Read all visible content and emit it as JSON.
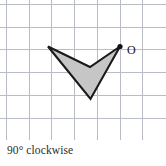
{
  "figure": {
    "caption": "90° clockwise",
    "corner_mark": "",
    "grid": {
      "line_color": "#b9bcc4",
      "background": "#ffffff",
      "spacing_px": 22.7,
      "x_positions": [
        6.5,
        29.2,
        51.9,
        74.6,
        97.3,
        120.0,
        142.7
      ],
      "y_positions": [
        4.5,
        27.2,
        49.9,
        72.6,
        95.3,
        118.0
      ],
      "x_extent": [
        0,
        166
      ],
      "y_extent": [
        0,
        140
      ],
      "show_grid": true
    },
    "shape": {
      "name": "chevron",
      "fill_color": "#c6c6c6",
      "stroke_color": "#1a1a1a",
      "stroke_width": 2.1,
      "vertices": [
        {
          "label": "left-tip",
          "x": 48.0,
          "y": 46.5
        },
        {
          "label": "notch",
          "x": 90.0,
          "y": 67.0
        },
        {
          "label": "O",
          "x": 120.0,
          "y": 46.5
        },
        {
          "label": "bottom-tip",
          "x": 90.5,
          "y": 99.0
        }
      ]
    },
    "markers": [
      {
        "name": "origin-point",
        "label": "O",
        "point_x": 120.0,
        "point_y": 46.5,
        "label_x": 127.0,
        "label_y": 54.0,
        "dot_radius": 2.6,
        "dot_color": "#111111"
      }
    ]
  }
}
